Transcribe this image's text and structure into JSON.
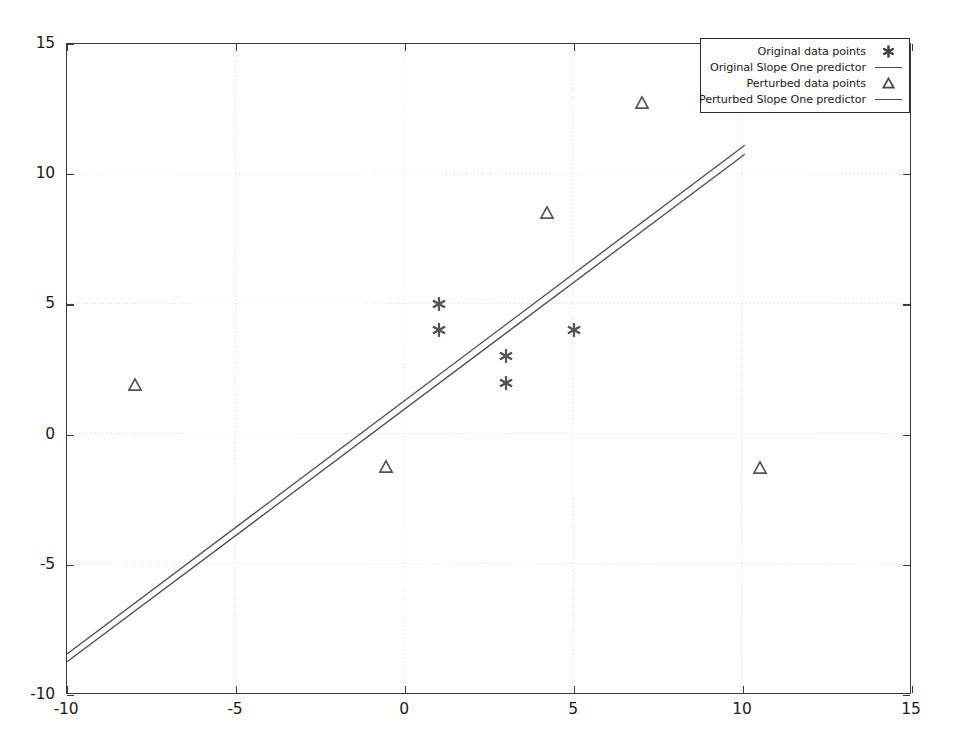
{
  "chart_data": {
    "type": "scatter",
    "title": "",
    "xlabel": "",
    "ylabel": "",
    "xlim": [
      -10,
      15
    ],
    "ylim": [
      -10,
      15
    ],
    "xticks": [
      -10,
      -5,
      0,
      5,
      10,
      15
    ],
    "yticks": [
      -10,
      -5,
      0,
      5,
      10,
      15
    ],
    "xtick_labels": [
      "-10",
      "-5",
      "0",
      "5",
      "10",
      "15"
    ],
    "ytick_labels": [
      "-10",
      "-5",
      "0",
      "5",
      "10",
      "15"
    ],
    "grid": true,
    "grid_style": "dotted",
    "legend_position": "top-right",
    "background_color": "#ffffff",
    "frame_color": "#3a3a3a",
    "series": [
      {
        "name": "Original data points",
        "type": "scatter",
        "marker": "asterisk",
        "color": "#555555",
        "points": [
          {
            "x": 1,
            "y": 5
          },
          {
            "x": 1,
            "y": 4
          },
          {
            "x": 3,
            "y": 3
          },
          {
            "x": 3,
            "y": 2
          },
          {
            "x": 5,
            "y": 4
          }
        ]
      },
      {
        "name": "Original Slope One predictor",
        "type": "line",
        "marker": "line",
        "color": "#4a4a4a",
        "points": [
          {
            "x": -10,
            "y": -8.5
          },
          {
            "x": 10.1,
            "y": 11.1
          }
        ]
      },
      {
        "name": "Perturbed data points",
        "type": "scatter",
        "marker": "triangle",
        "color": "#555555",
        "points": [
          {
            "x": -8,
            "y": 1.9
          },
          {
            "x": -0.55,
            "y": -1.25
          },
          {
            "x": 4.2,
            "y": 8.5
          },
          {
            "x": 7,
            "y": 12.75
          },
          {
            "x": 10.5,
            "y": -1.3
          }
        ]
      },
      {
        "name": "Perturbed Slope One predictor",
        "type": "line",
        "marker": "line",
        "color": "#4a4a4a",
        "points": [
          {
            "x": -10,
            "y": -8.8
          },
          {
            "x": 10.1,
            "y": 10.75
          }
        ]
      }
    ]
  },
  "legend": {
    "entries": [
      {
        "label": "Original data points",
        "key": "asterisk"
      },
      {
        "label": "Original Slope One predictor",
        "key": "line"
      },
      {
        "label": "Perturbed data points",
        "key": "triangle"
      },
      {
        "label": "Perturbed Slope One predictor",
        "key": "line"
      }
    ]
  }
}
